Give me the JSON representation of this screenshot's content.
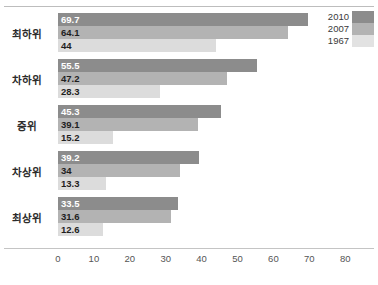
{
  "chart_data": {
    "type": "bar",
    "orientation": "horizontal",
    "title": "",
    "xlabel": "",
    "ylabel": "",
    "categories": [
      "최하위",
      "차하위",
      "중위",
      "차상위",
      "최상위"
    ],
    "series": [
      {
        "name": "2010",
        "color": "#8c8c8c",
        "values": [
          69.7,
          55.5,
          45.3,
          39.2,
          33.5
        ]
      },
      {
        "name": "2007",
        "color": "#b3b3b3",
        "values": [
          64.1,
          47.2,
          39.1,
          34,
          31.6
        ]
      },
      {
        "name": "1967",
        "color": "#dcdcdc",
        "values": [
          44,
          28.3,
          15.2,
          13.3,
          12.6
        ]
      }
    ],
    "value_labels": [
      [
        "69.7",
        "64.1",
        "44"
      ],
      [
        "55.5",
        "47.2",
        "28.3"
      ],
      [
        "45.3",
        "39.1",
        "15.2"
      ],
      [
        "39.2",
        "34",
        "13.3"
      ],
      [
        "33.5",
        "31.6",
        "12.6"
      ]
    ],
    "xticks": [
      "0",
      "10",
      "20",
      "30",
      "40",
      "50",
      "60",
      "70",
      "80"
    ],
    "xlim": [
      0,
      80
    ],
    "grid": false,
    "legend_position": "top-right"
  },
  "legend": {
    "entries": [
      {
        "label": "2010",
        "color": "#8c8c8c"
      },
      {
        "label": "2007",
        "color": "#b3b3b3"
      },
      {
        "label": "1967",
        "color": "#e2e2e2"
      }
    ]
  },
  "axis": {
    "ticks": [
      "0",
      "10",
      "20",
      "30",
      "40",
      "50",
      "60",
      "70",
      "80"
    ]
  },
  "groups": [
    {
      "category": "최하위",
      "bars": [
        {
          "series": "2010",
          "value": 69.7,
          "label": "69.7"
        },
        {
          "series": "2007",
          "value": 64.1,
          "label": "64.1"
        },
        {
          "series": "1967",
          "value": 44,
          "label": "44"
        }
      ]
    },
    {
      "category": "차하위",
      "bars": [
        {
          "series": "2010",
          "value": 55.5,
          "label": "55.5"
        },
        {
          "series": "2007",
          "value": 47.2,
          "label": "47.2"
        },
        {
          "series": "1967",
          "value": 28.3,
          "label": "28.3"
        }
      ]
    },
    {
      "category": "중위",
      "bars": [
        {
          "series": "2010",
          "value": 45.3,
          "label": "45.3"
        },
        {
          "series": "2007",
          "value": 39.1,
          "label": "39.1"
        },
        {
          "series": "1967",
          "value": 15.2,
          "label": "15.2"
        }
      ]
    },
    {
      "category": "차상위",
      "bars": [
        {
          "series": "2010",
          "value": 39.2,
          "label": "39.2"
        },
        {
          "series": "2007",
          "value": 34,
          "label": "34"
        },
        {
          "series": "1967",
          "value": 13.3,
          "label": "13.3"
        }
      ]
    },
    {
      "category": "최상위",
      "bars": [
        {
          "series": "2010",
          "value": 33.5,
          "label": "33.5"
        },
        {
          "series": "2007",
          "value": 31.6,
          "label": "31.6"
        },
        {
          "series": "1967",
          "value": 12.6,
          "label": "12.6"
        }
      ]
    }
  ]
}
